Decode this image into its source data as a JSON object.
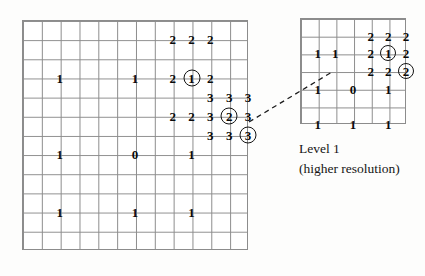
{
  "figure": {
    "title": "",
    "background_color": "#fdfdfc",
    "grid_line_color": "#8c8c8c",
    "digit_color": "#0a0a0a"
  },
  "coarse_grid": {
    "name": "Level 0 quadtree grid",
    "columns": 12,
    "rows": 12,
    "cells": [
      {
        "label": "2",
        "col": 8,
        "row": 1,
        "circled": false
      },
      {
        "label": "2",
        "col": 9,
        "row": 1,
        "circled": false
      },
      {
        "label": "2",
        "col": 10,
        "row": 1,
        "circled": false
      },
      {
        "label": "1",
        "col": 2,
        "row": 3,
        "circled": false
      },
      {
        "label": "1",
        "col": 6,
        "row": 3,
        "circled": false
      },
      {
        "label": "2",
        "col": 8,
        "row": 3,
        "circled": false
      },
      {
        "label": "1",
        "col": 9,
        "row": 3,
        "circled": true
      },
      {
        "label": "2",
        "col": 10,
        "row": 3,
        "circled": false
      },
      {
        "label": "3",
        "col": 10,
        "row": 4,
        "circled": false
      },
      {
        "label": "3",
        "col": 11,
        "row": 4,
        "circled": false
      },
      {
        "label": "3",
        "col": 12,
        "row": 4,
        "circled": false
      },
      {
        "label": "2",
        "col": 8,
        "row": 5,
        "circled": false
      },
      {
        "label": "2",
        "col": 9,
        "row": 5,
        "circled": false
      },
      {
        "label": "3",
        "col": 10,
        "row": 5,
        "circled": false
      },
      {
        "label": "2",
        "col": 11,
        "row": 5,
        "circled": true
      },
      {
        "label": "3",
        "col": 12,
        "row": 5,
        "circled": false
      },
      {
        "label": "3",
        "col": 10,
        "row": 6,
        "circled": false
      },
      {
        "label": "3",
        "col": 11,
        "row": 6,
        "circled": false
      },
      {
        "label": "3",
        "col": 12,
        "row": 6,
        "circled": true
      },
      {
        "label": "1",
        "col": 2,
        "row": 7,
        "circled": false
      },
      {
        "label": "0",
        "col": 6,
        "row": 7,
        "circled": false
      },
      {
        "label": "1",
        "col": 9,
        "row": 7,
        "circled": false
      },
      {
        "label": "1",
        "col": 2,
        "row": 10,
        "circled": false
      },
      {
        "label": "1",
        "col": 6,
        "row": 10,
        "circled": false
      },
      {
        "label": "1",
        "col": 9,
        "row": 10,
        "circled": false
      }
    ]
  },
  "fine_grid": {
    "name": "Level 1 quadtree grid",
    "columns": 6,
    "rows": 6,
    "cells": [
      {
        "label": "2",
        "col": 4,
        "row": 1,
        "circled": false
      },
      {
        "label": "2",
        "col": 5,
        "row": 1,
        "circled": false
      },
      {
        "label": "2",
        "col": 6,
        "row": 1,
        "circled": false
      },
      {
        "label": "1",
        "col": 1,
        "row": 2,
        "circled": false
      },
      {
        "label": "1",
        "col": 2,
        "row": 2,
        "circled": false
      },
      {
        "label": "2",
        "col": 4,
        "row": 2,
        "circled": false
      },
      {
        "label": "1",
        "col": 5,
        "row": 2,
        "circled": true
      },
      {
        "label": "2",
        "col": 6,
        "row": 2,
        "circled": false
      },
      {
        "label": "2",
        "col": 4,
        "row": 3,
        "circled": false
      },
      {
        "label": "2",
        "col": 5,
        "row": 3,
        "circled": false
      },
      {
        "label": "2",
        "col": 6,
        "row": 3,
        "circled": true
      },
      {
        "label": "1",
        "col": 1,
        "row": 4,
        "circled": false
      },
      {
        "label": "0",
        "col": 3,
        "row": 4,
        "circled": false
      },
      {
        "label": "1",
        "col": 5,
        "row": 4,
        "circled": false
      },
      {
        "label": "1",
        "col": 1,
        "row": 6,
        "circled": false
      },
      {
        "label": "1",
        "col": 3,
        "row": 6,
        "circled": false
      },
      {
        "label": "1",
        "col": 5,
        "row": 6,
        "circled": false
      }
    ]
  },
  "connector": {
    "name": "dashed-callout-line",
    "style": "dashed",
    "color": "#1d1d1d",
    "from": {
      "x": 249,
      "y": 122
    },
    "to": {
      "x": 332,
      "y": 72
    }
  },
  "caption": {
    "line1": "Level  1",
    "line2": "(higher resolution)"
  }
}
